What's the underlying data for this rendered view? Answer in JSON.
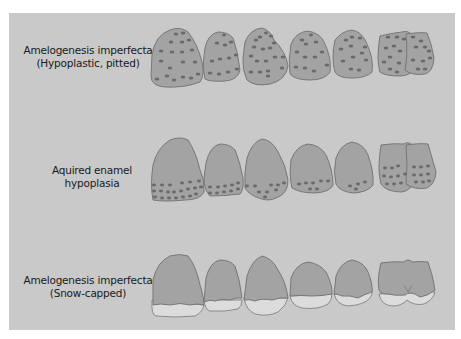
{
  "diagram": {
    "background_color": "#c9c9c9",
    "tooth_color": "#a3a3a3",
    "outline_color": "#7a7a7a",
    "pit_color": "#6a6a6a",
    "enamel_color": "#dcdcdc",
    "rows": [
      {
        "id": "hypoplastic-pitted",
        "label_line1": "Amelogenesis imperfecta",
        "label_line2": "(Hypoplastic, pitted)",
        "teeth_count": 6,
        "pattern": "pits distributed over entire crown surface"
      },
      {
        "id": "acquired-hypoplasia",
        "label_line1": "Aquired enamel",
        "label_line2": "hypoplasia",
        "teeth_count": 6,
        "pattern": "pits in horizontal bands near incisal third"
      },
      {
        "id": "snow-capped",
        "label_line1": "Amelogenesis imperfecta",
        "label_line2": "(Snow-capped)",
        "teeth_count": 6,
        "pattern": "white opaque enamel at incisal edges"
      }
    ]
  }
}
